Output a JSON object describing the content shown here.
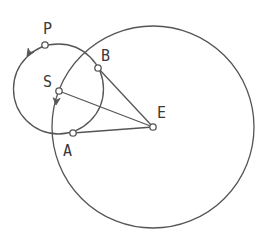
{
  "diagram": {
    "colors": {
      "stroke": "#555555",
      "point_fill": "#ffffff",
      "label": "#3a3a3a"
    },
    "circles": [
      {
        "name": "orbit-large",
        "cx": 153,
        "cy": 127,
        "r": 101
      },
      {
        "name": "orbit-small",
        "cx": 58.5,
        "cy": 89,
        "r": 45
      }
    ],
    "points": [
      {
        "id": "P",
        "label": "P",
        "x": 45,
        "y": 45,
        "lx": 43,
        "ly": 34
      },
      {
        "id": "B",
        "label": "B",
        "x": 98,
        "y": 68,
        "lx": 101,
        "ly": 61
      },
      {
        "id": "S",
        "label": "S",
        "x": 59,
        "y": 91,
        "lx": 43,
        "ly": 87
      },
      {
        "id": "A",
        "label": "A",
        "x": 73,
        "y": 133,
        "lx": 63,
        "ly": 156
      },
      {
        "id": "E",
        "label": "E",
        "x": 153,
        "y": 127,
        "lx": 157,
        "ly": 118
      }
    ],
    "segments": [
      {
        "from": "S",
        "to": "E"
      },
      {
        "from": "B",
        "to": "E"
      },
      {
        "from": "A",
        "to": "E"
      }
    ],
    "arrows": [
      {
        "name": "arrow-small-orbit",
        "x": 27,
        "y": 56,
        "angle": 125
      },
      {
        "name": "arrow-large-orbit",
        "x": 56,
        "y": 105,
        "angle": 95
      }
    ]
  }
}
